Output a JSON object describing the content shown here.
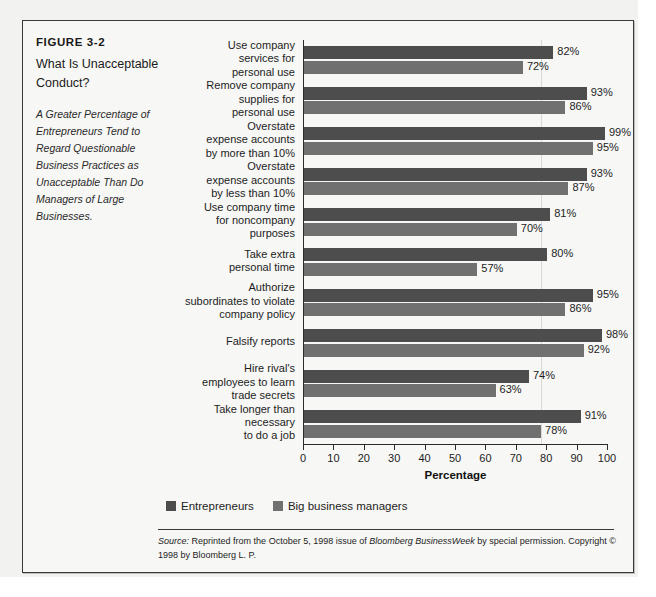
{
  "figure": {
    "number": "FIGURE 3-2",
    "title": "What Is Unacceptable Conduct?",
    "subtitle": "A Greater Percentage of Entrepreneurs Tend to Regard Questionable Business Practices as Unacceptable Than Do Managers of Large Businesses."
  },
  "source": {
    "label": "Source:",
    "text_1": " Reprinted from the October 5, 1998 issue of ",
    "italic_1": "Bloomberg BusinessWeek",
    "text_2": " by special permission. Copyright © 1998 by Bloomberg L. P."
  },
  "chart_data": {
    "type": "bar",
    "orientation": "horizontal",
    "title": "What Is Unacceptable Conduct?",
    "xlabel": "Percentage",
    "ylabel": "",
    "xlim": [
      0,
      100
    ],
    "xticks": [
      0,
      10,
      20,
      30,
      40,
      50,
      60,
      70,
      80,
      90,
      100
    ],
    "xtick_labels": [
      "0",
      "10",
      "20",
      "30",
      "40",
      "50",
      "60",
      "70",
      "80",
      "90",
      "100"
    ],
    "grid": true,
    "gridlines_at": [
      78
    ],
    "legend_position": "bottom-left",
    "categories": [
      "Use company\nservices for\npersonal use",
      "Remove company\nsupplies for\npersonal use",
      "Overstate\nexpense accounts\nby more than 10%",
      "Overstate\nexpense accounts\nby less than 10%",
      "Use company time\nfor noncompany\npurposes",
      "Take extra\npersonal time",
      "Authorize\nsubordinates to violate\ncompany policy",
      "Falsify reports",
      "Hire rival's\nemployees to learn\ntrade secrets",
      "Take longer than\nnecessary\nto do a job"
    ],
    "series": [
      {
        "name": "Entrepreneurs",
        "color": "#4d4d4d",
        "values": [
          82,
          93,
          99,
          93,
          81,
          80,
          95,
          98,
          74,
          91
        ],
        "value_labels": [
          "82%",
          "93%",
          "99%",
          "93%",
          "81%",
          "80%",
          "95%",
          "98%",
          "74%",
          "91%"
        ]
      },
      {
        "name": "Big business managers",
        "color": "#707070",
        "values": [
          72,
          86,
          95,
          87,
          70,
          57,
          86,
          92,
          63,
          78
        ],
        "value_labels": [
          "72%",
          "86%",
          "95%",
          "87%",
          "70%",
          "57%",
          "86%",
          "92%",
          "63%",
          "78%"
        ]
      }
    ]
  }
}
